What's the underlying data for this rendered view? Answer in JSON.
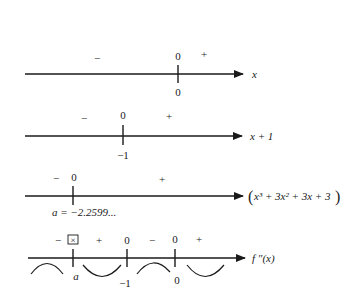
{
  "diagram": {
    "type": "sign-chart",
    "rows": [
      {
        "id": "x",
        "label": "x",
        "zero_label": "0",
        "tick_value": "0",
        "signs": {
          "left": "−",
          "right": "+"
        }
      },
      {
        "id": "x_plus_1",
        "label": "x + 1",
        "zero_label": "0",
        "tick_value": "−1",
        "signs": {
          "left": "−",
          "right": "+"
        }
      },
      {
        "id": "cubic",
        "label_open": "(",
        "label_body": "x³ + 3x² + 3x + 3",
        "label_close": ")",
        "zero_label": "0",
        "tick_value": "a = −2.2599...",
        "signs": {
          "left": "−",
          "right": "+"
        }
      },
      {
        "id": "f_double_prime",
        "label": "f ″(x)",
        "markers": [
          "☒",
          "0",
          "0"
        ],
        "tick_values": [
          "a",
          "−1",
          "0"
        ],
        "signs": [
          "−",
          "+",
          "−",
          "+"
        ],
        "concavity": [
          "down",
          "up",
          "down",
          "up"
        ]
      }
    ]
  }
}
